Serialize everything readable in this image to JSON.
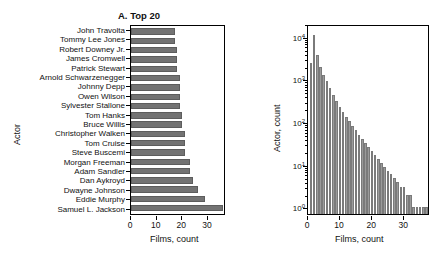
{
  "figure": {
    "panels": [
      {
        "id": "A",
        "title": "A. Top 20",
        "xlabel": "Films, count",
        "ylabel": "Actor"
      },
      {
        "id": "B",
        "title": "B. Entire distribution",
        "xlabel": "Films, count",
        "ylabel": "Actor, count"
      }
    ]
  },
  "chart_data": [
    {
      "type": "bar",
      "orientation": "horizontal",
      "title": "A. Top 20",
      "xlabel": "Films, count",
      "ylabel": "Actor",
      "xlim": [
        0,
        37
      ],
      "xticks": [
        0,
        10,
        20,
        30
      ],
      "xticklabels": [
        "0",
        "10",
        "20",
        "30"
      ],
      "grid": false,
      "legend": null,
      "bar_color": "#737373",
      "categories": [
        "John Travolta",
        "Tommy Lee Jones",
        "Robert Downey Jr.",
        "James Cromwell",
        "Patrick Stewart",
        "Arnold Schwarzenegger",
        "Johnny Depp",
        "Owen Wilson",
        "Sylvester Stallone",
        "Tom Hanks",
        "Bruce Willis",
        "Christopher Walken",
        "Tom Cruise",
        "Steve Buscemi",
        "Morgan Freeman",
        "Adam Sandler",
        "Dan Aykroyd",
        "Dwayne Johnson",
        "Eddie Murphy",
        "Samuel L. Jackson"
      ],
      "values": [
        17,
        17,
        18,
        18,
        18,
        19,
        19,
        19,
        19,
        20,
        20,
        21,
        21,
        21,
        23,
        23,
        24,
        26,
        29,
        36
      ]
    },
    {
      "type": "bar",
      "subtype": "histogram",
      "title": "B. Entire distribution",
      "xlabel": "Films, count",
      "ylabel": "Actor, count",
      "xlim": [
        0,
        38
      ],
      "xticks": [
        0,
        10,
        20,
        30
      ],
      "xticklabels": [
        "0",
        "10",
        "20",
        "30"
      ],
      "yscale": "log",
      "ylim": [
        0.7,
        20000
      ],
      "yticks": [
        1,
        10,
        100,
        1000,
        10000
      ],
      "yticklabels": [
        "10⁰",
        "10¹",
        "10²",
        "10³",
        "10⁴"
      ],
      "grid": false,
      "legend": null,
      "bar_color": "#9a9a9a",
      "x": [
        1,
        2,
        3,
        4,
        5,
        6,
        7,
        8,
        9,
        10,
        11,
        12,
        13,
        14,
        15,
        16,
        17,
        18,
        19,
        20,
        21,
        22,
        23,
        24,
        25,
        26,
        27,
        28,
        29,
        30,
        31,
        32,
        33,
        34,
        35,
        36,
        37
      ],
      "values": [
        2400,
        11000,
        3800,
        2000,
        1300,
        900,
        620,
        430,
        310,
        230,
        175,
        135,
        105,
        82,
        64,
        50,
        40,
        32,
        26,
        21,
        17,
        14,
        11,
        9,
        7,
        6,
        5,
        4,
        3,
        3,
        2,
        2,
        1,
        1,
        1,
        1,
        1
      ],
      "counts_note": "Counts read off log axis; bin width = 1 film"
    }
  ]
}
